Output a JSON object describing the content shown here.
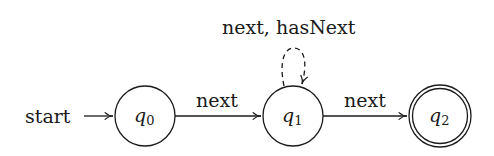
{
  "diagram": {
    "type": "finite-state-automaton",
    "start_label": "start",
    "states": [
      {
        "id": "q0",
        "name": "q",
        "subscript": "0",
        "accepting": false,
        "initial": true
      },
      {
        "id": "q1",
        "name": "q",
        "subscript": "1",
        "accepting": false,
        "initial": false
      },
      {
        "id": "q2",
        "name": "q",
        "subscript": "2",
        "accepting": true,
        "initial": false
      }
    ],
    "transitions": [
      {
        "from": "q0",
        "to": "q1",
        "label": "next",
        "style": "solid"
      },
      {
        "from": "q1",
        "to": "q1",
        "label": "next, hasNext",
        "style": "dashed"
      },
      {
        "from": "q1",
        "to": "q2",
        "label": "next",
        "style": "solid"
      }
    ],
    "colors": {
      "stroke": "#1a1a1a",
      "background": "#ffffff"
    }
  }
}
